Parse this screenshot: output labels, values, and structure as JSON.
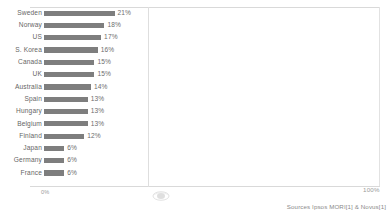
{
  "chart_data": {
    "type": "bar",
    "orientation": "horizontal",
    "title": "",
    "xlabel": "",
    "ylabel": "",
    "xlim": [
      0,
      100
    ],
    "grid": false,
    "legend": null,
    "categories": [
      "Sweden",
      "Norway",
      "US",
      "S. Korea",
      "Canada",
      "UK",
      "Australia",
      "Spain",
      "Hungary",
      "Belgium",
      "Finland",
      "Japan",
      "Germany",
      "France"
    ],
    "values": [
      21,
      18,
      17,
      16,
      15,
      15,
      14,
      13,
      13,
      13,
      12,
      6,
      6,
      6
    ],
    "value_labels": [
      "21%",
      "18%",
      "17%",
      "16%",
      "15%",
      "15%",
      "14%",
      "13%",
      "13%",
      "13%",
      "12%",
      "6%",
      "6%",
      "6%"
    ],
    "axis_tick_labels": [
      "0%",
      "100%"
    ],
    "bar_color": "#7e7e7e",
    "text_color": "#666666"
  },
  "axis": {
    "min_label": "0%",
    "max_label": "100%"
  },
  "footer": {
    "source": "Sources Ipsos MORI[1] & Novus[1]"
  },
  "watermark": {
    "name": "oval-logo-watermark"
  }
}
